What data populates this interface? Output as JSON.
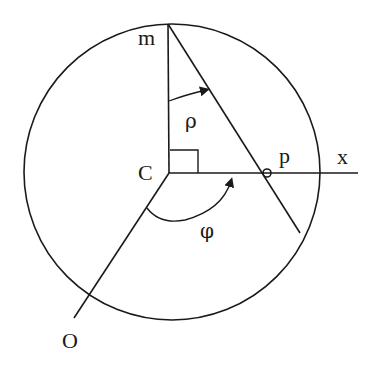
{
  "diagram": {
    "labels": {
      "m": "m",
      "rho": "ρ",
      "c": "C",
      "p": "p",
      "x": "x",
      "phi": "φ",
      "o": "O"
    },
    "colors": {
      "stroke": "#1a1a1a",
      "background": "#ffffff"
    }
  }
}
